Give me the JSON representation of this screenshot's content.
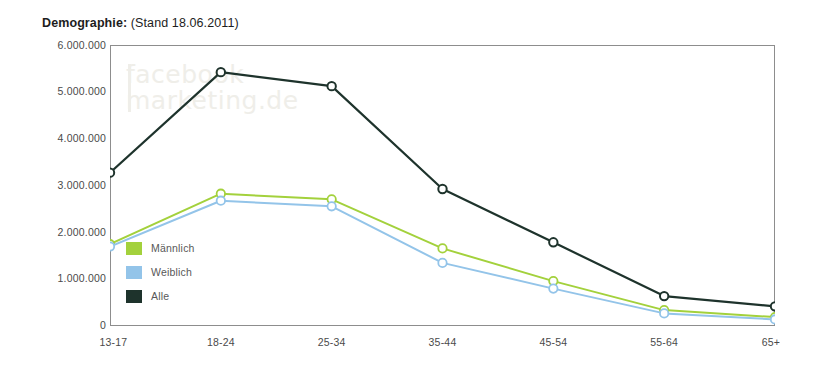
{
  "chart_title": {
    "bold_part": "Demographie:",
    "rest": " (Stand 18.06.2011)"
  },
  "watermark": {
    "line1": "facebook",
    "line2": "marketing.de"
  },
  "legend": {
    "items": [
      {
        "label": "Männlich",
        "color": "#a3d13c",
        "name": "legend-maennlich"
      },
      {
        "label": "Weiblich",
        "color": "#93c4e9",
        "name": "legend-weiblich"
      },
      {
        "label": "Alle",
        "color": "#1e332c",
        "name": "legend-alle"
      }
    ]
  },
  "chart_data": {
    "type": "line",
    "title": "Demographie: (Stand 18.06.2011)",
    "xlabel": "",
    "ylabel": "",
    "categories": [
      "13-17",
      "18-24",
      "25-34",
      "35-44",
      "45-54",
      "55-64",
      "65+"
    ],
    "ylim": [
      0,
      6000000
    ],
    "yticks": [
      0,
      1000000,
      2000000,
      3000000,
      4000000,
      5000000,
      6000000
    ],
    "ytick_labels": [
      "0",
      "1.000.000",
      "2.000.000",
      "3.000.000",
      "4.000.000",
      "5.000.000",
      "6.000.000"
    ],
    "grid": false,
    "legend_position": "inside-left",
    "series": [
      {
        "name": "Alle",
        "color": "#1e332c",
        "values": [
          3280000,
          5430000,
          5130000,
          2930000,
          1790000,
          640000,
          420000
        ]
      },
      {
        "name": "Männlich",
        "color": "#a3d13c",
        "values": [
          1750000,
          2830000,
          2710000,
          1660000,
          960000,
          340000,
          190000
        ]
      },
      {
        "name": "Weiblich",
        "color": "#93c4e9",
        "values": [
          1700000,
          2680000,
          2560000,
          1350000,
          800000,
          270000,
          140000
        ]
      }
    ]
  }
}
